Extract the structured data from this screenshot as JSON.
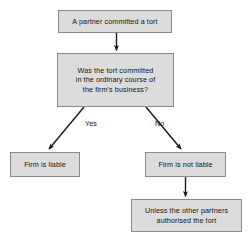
{
  "diagram": {
    "type": "flowchart",
    "style": {
      "node_fill": "#dcdcdc",
      "node_border": "#8a8a8a",
      "connector_color": "#1a1a1a",
      "background": "#ffffff",
      "text_color": "#151515"
    },
    "nodes": [
      {
        "id": "start",
        "shape": "rectangle",
        "text": "A partner committed a tort",
        "lines": [
          "A partner committed a tort"
        ]
      },
      {
        "id": "decision",
        "shape": "rectangle",
        "text": "Was the tort committed in the ordinary course of the firm's business?",
        "lines": [
          "Was the tort committed",
          "in the ordinary course of",
          "the firm's business?"
        ]
      },
      {
        "id": "liable",
        "shape": "rectangle",
        "text": "Firm is liable",
        "lines": [
          "Firm is liable"
        ]
      },
      {
        "id": "not_liable",
        "shape": "rectangle",
        "text": "Firm is not liable",
        "lines": [
          "Firm is not liable"
        ]
      },
      {
        "id": "unless",
        "shape": "rectangle",
        "text": "Unless the other partners authorised the tort",
        "lines": [
          "Unless the other partners",
          "authorised the tort"
        ]
      }
    ],
    "edges": [
      {
        "id": "e1",
        "from": "start",
        "to": "decision",
        "label": "",
        "direction": "down"
      },
      {
        "id": "e2",
        "from": "decision",
        "to": "liable",
        "label": "Yes",
        "direction": "down-left"
      },
      {
        "id": "e3",
        "from": "decision",
        "to": "not_liable",
        "label": "No",
        "direction": "down-right"
      },
      {
        "id": "e4",
        "from": "not_liable",
        "to": "unless",
        "label": "",
        "direction": "down"
      }
    ],
    "labels": {
      "yes": "Yes",
      "no": "No"
    }
  }
}
